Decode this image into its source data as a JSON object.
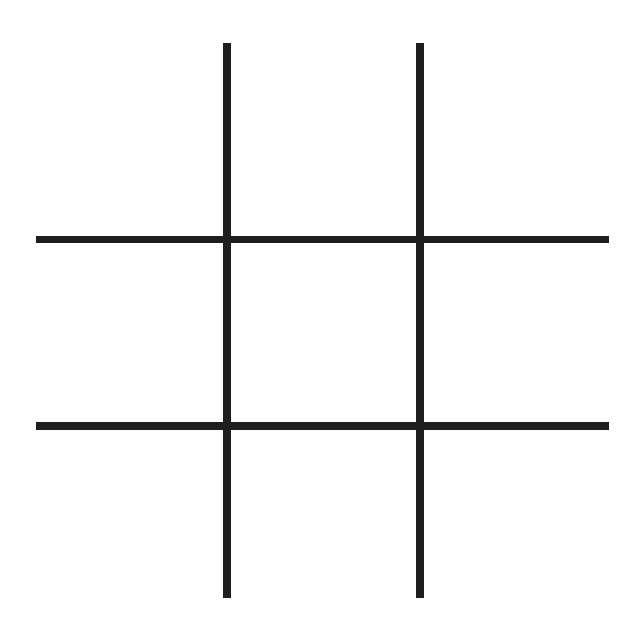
{
  "game": {
    "type": "tic-tac-toe",
    "line_color": "#1e1e1e",
    "background": "#ffffff",
    "grid": {
      "vertical_lines": [
        {
          "x": 223,
          "y_start": 43,
          "y_end": 598,
          "thickness": 8
        },
        {
          "x": 416,
          "y_start": 43,
          "y_end": 598,
          "thickness": 8
        }
      ],
      "horizontal_lines": [
        {
          "y": 236,
          "x_start": 36,
          "x_end": 609,
          "thickness": 8
        },
        {
          "y": 422,
          "x_start": 36,
          "x_end": 609,
          "thickness": 8
        }
      ]
    },
    "cells": [
      [
        "",
        "",
        ""
      ],
      [
        "",
        "",
        ""
      ],
      [
        "",
        "",
        ""
      ]
    ]
  }
}
